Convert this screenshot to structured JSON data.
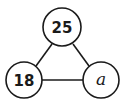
{
  "diagram": {
    "type": "triangle-number-diagram",
    "nodes": [
      {
        "id": "top",
        "label": "25",
        "cx": 62,
        "cy": 27,
        "r": 19
      },
      {
        "id": "left",
        "label": "18",
        "cx": 24,
        "cy": 80,
        "r": 18
      },
      {
        "id": "right",
        "label": "a",
        "cx": 101,
        "cy": 80,
        "r": 18
      }
    ],
    "edges": [
      {
        "from": "top",
        "to": "left"
      },
      {
        "from": "top",
        "to": "right"
      },
      {
        "from": "left",
        "to": "right"
      }
    ],
    "stroke_color": "#1a1a1a",
    "fill_color": "#ffffff"
  }
}
